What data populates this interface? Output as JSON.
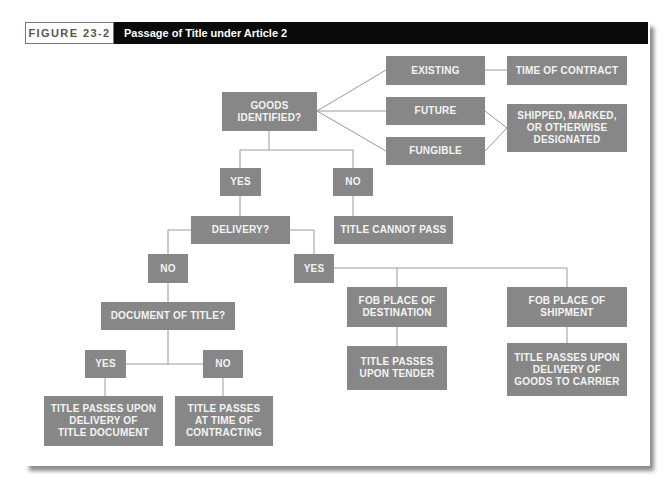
{
  "figure": {
    "label": "FIGURE 23-2",
    "title": "Passage of Title under Article 2"
  },
  "colors": {
    "node_fill": "#878787",
    "node_text": "#f4f4f4",
    "connector": "#9a9a9a",
    "title_bar": "#0a0a0a"
  },
  "nodes": {
    "goods_identified": "GOODS\nIDENTIFIED?",
    "existing": "EXISTING",
    "future": "FUTURE",
    "fungible": "FUNGIBLE",
    "time_of_contract": "TIME OF CONTRACT",
    "shipped_marked": "SHIPPED, MARKED,\nOR OTHERWISE\nDESIGNATED",
    "identified_yes": "YES",
    "identified_no": "NO",
    "delivery": "DELIVERY?",
    "title_cannot_pass": "TITLE CANNOT PASS",
    "delivery_no": "NO",
    "delivery_yes": "YES",
    "document_of_title": "DOCUMENT OF TITLE?",
    "document_yes": "YES",
    "document_no": "NO",
    "passes_upon_delivery_document": "TITLE PASSES UPON\nDELIVERY OF\nTITLE DOCUMENT",
    "passes_time_of_contracting": "TITLE PASSES\nAT TIME OF\nCONTRACTING",
    "fob_destination": "FOB PLACE OF\nDESTINATION",
    "passes_upon_tender": "TITLE PASSES\nUPON TENDER",
    "fob_shipment": "FOB PLACE OF\nSHIPMENT",
    "passes_delivery_carrier": "TITLE PASSES UPON\nDELIVERY OF\nGOODS TO CARRIER"
  }
}
